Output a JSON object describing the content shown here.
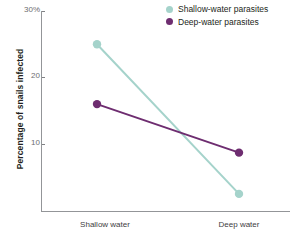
{
  "chart_data": {
    "type": "line",
    "title": "",
    "xlabel": "",
    "ylabel": "Percentage of snails infected",
    "categories": [
      "Shallow water",
      "Deep water"
    ],
    "ylim": [
      0,
      30
    ],
    "ytick_values": [
      30,
      20,
      10
    ],
    "ytick_labels": [
      "30%",
      "20",
      "10"
    ],
    "grid": false,
    "legend_position": "top-right",
    "series": [
      {
        "name": "Shallow-water parasites",
        "color": "#a5d3cb",
        "values": [
          25.0,
          2.5
        ]
      },
      {
        "name": "Deep-water parasites",
        "color": "#6e2d70",
        "values": [
          16.0,
          8.7
        ]
      }
    ]
  },
  "axes": {
    "y_title": "Percentage of snails infected",
    "y_ticks": [
      {
        "label": "30%",
        "value": 30
      },
      {
        "label": "20",
        "value": 20
      },
      {
        "label": "10",
        "value": 10
      }
    ],
    "x_ticks": [
      {
        "label": "Shallow water"
      },
      {
        "label": "Deep water"
      }
    ]
  },
  "legend": {
    "items": [
      {
        "label": "Shallow-water parasites",
        "color": "#a5d3cb"
      },
      {
        "label": "Deep-water parasites",
        "color": "#6e2d70"
      }
    ]
  },
  "colors": {
    "shallow": "#a5d3cb",
    "deep": "#6e2d70",
    "axis": "#939598",
    "tick_text": "#6d6e71",
    "label_text": "#231f20",
    "background": "#ffffff"
  }
}
